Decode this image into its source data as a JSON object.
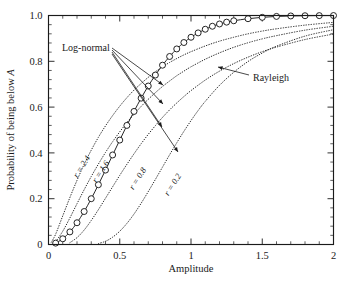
{
  "chart_data": {
    "type": "line",
    "title": "",
    "xlabel": "Amplitude",
    "ylabel": "Probability of being below A",
    "ylabel_plain": "Probability of being below",
    "ylabel_italic": "A",
    "xlim": [
      0,
      2
    ],
    "ylim": [
      0,
      1
    ],
    "grid": false,
    "legend_position": "inline-annotations",
    "xticks": [
      0,
      0.5,
      1,
      1.5,
      2
    ],
    "xtick_labels": [
      "0",
      "0.5",
      "1",
      "1.5",
      "2"
    ],
    "xtick_minor_step": 0.1,
    "yticks": [
      0,
      0.2,
      0.4,
      0.6,
      0.8,
      1.0
    ],
    "ytick_labels": [
      "0",
      "0.2",
      "0.4",
      "0.6",
      "0.8",
      "1.0"
    ],
    "ytick_minor_step": 0.04,
    "annotations": [
      {
        "name": "log-normal-annotation",
        "text": "Log-normal",
        "x_px": 62,
        "y_px": 48
      },
      {
        "name": "rayleigh-annotation",
        "text": "Rayleigh",
        "x_px": 253,
        "y_px": 78
      }
    ],
    "series": [
      {
        "name": "Rayleigh",
        "label": "Rayleigh",
        "style": "solid-with-open-circle-markers",
        "marker": "open-circle",
        "x": [
          0.05,
          0.1,
          0.15,
          0.2,
          0.25,
          0.3,
          0.35,
          0.4,
          0.45,
          0.5,
          0.55,
          0.6,
          0.65,
          0.7,
          0.75,
          0.8,
          0.85,
          0.9,
          0.95,
          1.0,
          1.05,
          1.1,
          1.15,
          1.2,
          1.25,
          1.3,
          1.4,
          1.5,
          1.6,
          1.7,
          1.8,
          1.9,
          2.0
        ],
        "y": [
          0.006,
          0.025,
          0.055,
          0.095,
          0.144,
          0.2,
          0.261,
          0.325,
          0.391,
          0.456,
          0.52,
          0.581,
          0.639,
          0.692,
          0.74,
          0.783,
          0.821,
          0.854,
          0.882,
          0.905,
          0.924,
          0.94,
          0.953,
          0.963,
          0.971,
          0.977,
          0.986,
          0.992,
          0.996,
          0.998,
          0.999,
          0.9995,
          0.9998
        ]
      },
      {
        "name": "Log-normal r = 2.4",
        "label": "r = 2.4",
        "label_x_px": 84,
        "label_y_px": 168,
        "style": "dotted",
        "x": [
          0.02,
          0.05,
          0.1,
          0.15,
          0.2,
          0.25,
          0.3,
          0.35,
          0.4,
          0.45,
          0.5,
          0.55,
          0.6,
          0.65,
          0.7,
          0.75,
          0.8,
          0.85,
          0.9,
          0.95,
          1.0,
          1.1,
          1.2,
          1.3,
          1.4,
          1.5,
          1.6,
          1.8,
          2.0
        ],
        "y": [
          0.01,
          0.045,
          0.125,
          0.205,
          0.28,
          0.35,
          0.412,
          0.468,
          0.518,
          0.563,
          0.604,
          0.641,
          0.674,
          0.703,
          0.73,
          0.754,
          0.776,
          0.795,
          0.812,
          0.828,
          0.842,
          0.867,
          0.888,
          0.905,
          0.92,
          0.932,
          0.942,
          0.958,
          0.97
        ]
      },
      {
        "name": "Log-normal r = 1.6",
        "label": "r = 1.6",
        "label_x_px": 103,
        "label_y_px": 173,
        "style": "dotted",
        "x": [
          0.05,
          0.1,
          0.15,
          0.2,
          0.25,
          0.3,
          0.35,
          0.4,
          0.45,
          0.5,
          0.55,
          0.6,
          0.65,
          0.7,
          0.75,
          0.8,
          0.85,
          0.9,
          0.95,
          1.0,
          1.1,
          1.2,
          1.3,
          1.4,
          1.5,
          1.6,
          1.8,
          2.0
        ],
        "y": [
          0.012,
          0.058,
          0.116,
          0.178,
          0.239,
          0.297,
          0.351,
          0.402,
          0.449,
          0.492,
          0.532,
          0.569,
          0.603,
          0.634,
          0.663,
          0.69,
          0.714,
          0.737,
          0.757,
          0.776,
          0.809,
          0.837,
          0.861,
          0.881,
          0.898,
          0.912,
          0.936,
          0.953
        ]
      },
      {
        "name": "Log-normal r = 0.8",
        "label": "r = 0.8",
        "label_x_px": 140,
        "label_y_px": 180,
        "style": "dotted",
        "x": [
          0.15,
          0.2,
          0.25,
          0.3,
          0.35,
          0.4,
          0.45,
          0.5,
          0.55,
          0.6,
          0.65,
          0.7,
          0.75,
          0.8,
          0.85,
          0.9,
          0.95,
          1.0,
          1.1,
          1.2,
          1.3,
          1.4,
          1.5,
          1.6,
          1.8,
          2.0
        ],
        "y": [
          0.008,
          0.03,
          0.063,
          0.105,
          0.152,
          0.202,
          0.252,
          0.302,
          0.35,
          0.396,
          0.44,
          0.481,
          0.519,
          0.555,
          0.588,
          0.618,
          0.646,
          0.672,
          0.718,
          0.757,
          0.79,
          0.818,
          0.842,
          0.862,
          0.895,
          0.919
        ]
      },
      {
        "name": "Log-normal r = 0.2",
        "label": "r = 0.2",
        "label_x_px": 175,
        "label_y_px": 186,
        "style": "dotted",
        "x": [
          0.35,
          0.4,
          0.45,
          0.5,
          0.55,
          0.6,
          0.65,
          0.7,
          0.75,
          0.8,
          0.85,
          0.9,
          0.95,
          1.0,
          1.05,
          1.1,
          1.2,
          1.3,
          1.4,
          1.5,
          1.6,
          1.8,
          2.0
        ],
        "y": [
          0.004,
          0.014,
          0.032,
          0.058,
          0.092,
          0.133,
          0.18,
          0.231,
          0.284,
          0.338,
          0.392,
          0.444,
          0.494,
          0.541,
          0.585,
          0.625,
          0.695,
          0.752,
          0.799,
          0.836,
          0.866,
          0.91,
          0.938
        ]
      }
    ],
    "leader_lines": [
      {
        "from_x_px": 112,
        "from_y_px": 48,
        "to_x_px": 163,
        "to_y_px": 85
      },
      {
        "from_x_px": 112,
        "from_y_px": 50,
        "to_x_px": 163,
        "to_y_px": 104
      },
      {
        "from_x_px": 112,
        "from_y_px": 52,
        "to_x_px": 162,
        "to_y_px": 127
      },
      {
        "from_x_px": 112,
        "from_y_px": 54,
        "to_x_px": 178,
        "to_y_px": 152
      }
    ],
    "rayleigh_leader": {
      "from_x_px": 249,
      "from_y_px": 75,
      "to_x_px": 218,
      "to_y_px": 67
    }
  }
}
